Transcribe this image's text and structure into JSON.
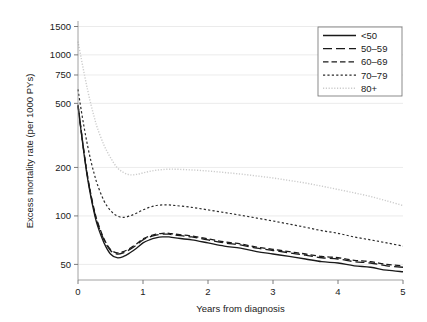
{
  "figure": {
    "background": "#ffffff",
    "plot_background": "#ffffff"
  },
  "chart_data": {
    "type": "line",
    "title": "",
    "xlabel": "Years from diagnosis",
    "ylabel": "Excess mortality rate (per 1000 PYs)",
    "yscale": "log",
    "xlim": [
      0,
      5
    ],
    "ylim": [
      40,
      1600
    ],
    "grid": true,
    "legend_position": "top-right",
    "legend_title": "",
    "xticks": [
      0,
      1,
      2,
      3,
      4,
      5
    ],
    "xtick_labels": [
      "0",
      "1",
      "2",
      "3",
      "4",
      "5"
    ],
    "yticks": [
      50,
      100,
      200,
      500,
      750,
      1000,
      1500
    ],
    "ytick_labels": [
      "50",
      "100",
      "200",
      "500",
      "750",
      "1000",
      "1500"
    ],
    "x": [
      0,
      0.05,
      0.1,
      0.15,
      0.2,
      0.25,
      0.3,
      0.4,
      0.5,
      0.6,
      0.7,
      0.8,
      0.9,
      1.0,
      1.1,
      1.2,
      1.3,
      1.4,
      1.5,
      1.75,
      2.0,
      2.25,
      2.5,
      2.75,
      3.0,
      3.25,
      3.5,
      3.75,
      4.0,
      4.25,
      4.5,
      4.75,
      5.0
    ],
    "series": [
      {
        "name": "<50",
        "label": "<50",
        "dash": "solid",
        "color": "#1a1a1a",
        "width": 1.3,
        "values": [
          480,
          330,
          230,
          168,
          130,
          104,
          87,
          68,
          58,
          55,
          56,
          59,
          63,
          68,
          71,
          73,
          74,
          74,
          73,
          71,
          68,
          65,
          63,
          60,
          58,
          56,
          54,
          52,
          51,
          49,
          48,
          46,
          45
        ]
      },
      {
        "name": "50-59",
        "label": "50–59",
        "dash": "longdash",
        "color": "#1a1a1a",
        "width": 1.3,
        "values": [
          485,
          335,
          234,
          172,
          133,
          107,
          90,
          71,
          61,
          58,
          59,
          62,
          66,
          71,
          74,
          76,
          77,
          77,
          76,
          74,
          71,
          68,
          66,
          63,
          61,
          59,
          57,
          55,
          54,
          52,
          51,
          49,
          48
        ]
      },
      {
        "name": "60-69",
        "label": "60–69",
        "dash": "dash",
        "color": "#1a1a1a",
        "width": 1.3,
        "values": [
          490,
          338,
          237,
          174,
          135,
          109,
          92,
          72,
          62,
          59,
          60,
          63,
          67,
          72,
          75,
          77,
          78,
          78,
          77,
          75,
          72,
          69,
          67,
          64,
          62,
          60,
          58,
          56,
          55,
          53,
          52,
          50,
          49
        ]
      },
      {
        "name": "70-79",
        "label": "70–79",
        "dash": "dotted",
        "color": "#2b2b2b",
        "width": 1.2,
        "values": [
          610,
          452,
          344,
          270,
          218,
          182,
          156,
          124,
          108,
          100,
          98,
          100,
          104,
          109,
          113,
          116,
          117,
          117,
          116,
          113,
          109,
          105,
          101,
          97,
          93,
          89,
          85,
          81,
          78,
          74,
          71,
          68,
          65
        ]
      },
      {
        "name": "80+",
        "label": "80+",
        "dash": "finedot",
        "color": "#cccccc",
        "width": 1.4,
        "values": [
          1210,
          950,
          750,
          600,
          490,
          410,
          350,
          275,
          230,
          200,
          186,
          180,
          181,
          185,
          189,
          192,
          194,
          195,
          195,
          193,
          190,
          186,
          182,
          177,
          172,
          166,
          160,
          153,
          146,
          139,
          132,
          124,
          116
        ]
      }
    ]
  },
  "axes": {
    "x_title": "Years from diagnosis",
    "y_title": "Excess mortality rate (per 1000 PYs)"
  }
}
